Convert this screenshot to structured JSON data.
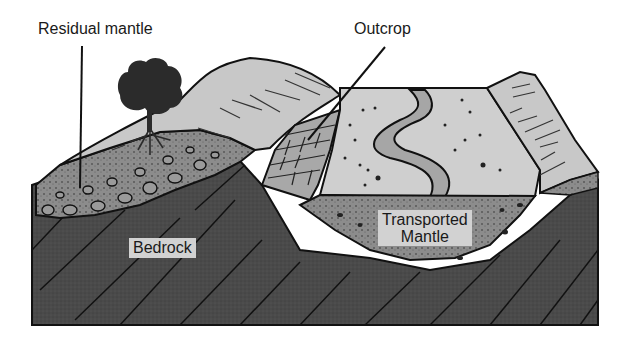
{
  "diagram": {
    "type": "geologic block diagram",
    "labels": {
      "residual_mantle": "Residual mantle",
      "outcrop": "Outcrop",
      "bedrock": "Bedrock",
      "transported_mantle_line1": "Transported",
      "transported_mantle_line2": "Mantle"
    },
    "colors": {
      "bedrock": "#4a4a4a",
      "residual_mantle": "#8c8c8c",
      "transported_mantle": "#8a8a8a",
      "surface": "#cfcfcf",
      "hill_surface": "#c8c8c8",
      "river": "#a6a6a6",
      "outcrop": "#a8a8a8",
      "tree": "#2b2b2b",
      "outline": "#111111",
      "label_box": "#d2d2d2"
    }
  }
}
